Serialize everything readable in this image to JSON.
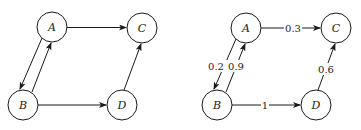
{
  "graphs": [
    {
      "name": "unweighted",
      "nodes": [
        {
          "id": "A",
          "label": "A",
          "x": 52,
          "y": 27
        },
        {
          "id": "B",
          "label": "B",
          "x": 23,
          "y": 105
        },
        {
          "id": "C",
          "label": "C",
          "x": 142,
          "y": 28
        },
        {
          "id": "D",
          "label": "D",
          "x": 122,
          "y": 105
        }
      ],
      "edges": [
        {
          "from": "A",
          "to": "C",
          "label": ""
        },
        {
          "from": "A",
          "to": "B",
          "label": ""
        },
        {
          "from": "B",
          "to": "A",
          "label": ""
        },
        {
          "from": "B",
          "to": "D",
          "label": ""
        },
        {
          "from": "D",
          "to": "C",
          "label": ""
        }
      ]
    },
    {
      "name": "weighted",
      "nodes": [
        {
          "id": "A",
          "label": "A",
          "x": 246,
          "y": 28
        },
        {
          "id": "B",
          "label": "B",
          "x": 217,
          "y": 105
        },
        {
          "id": "C",
          "label": "C",
          "x": 336,
          "y": 28
        },
        {
          "id": "D",
          "label": "D",
          "x": 316,
          "y": 105
        }
      ],
      "edges": [
        {
          "from": "A",
          "to": "C",
          "label": "0.3"
        },
        {
          "from": "A",
          "to": "B",
          "label": "0.2"
        },
        {
          "from": "B",
          "to": "A",
          "label": "0.9"
        },
        {
          "from": "B",
          "to": "D",
          "label": "1"
        },
        {
          "from": "D",
          "to": "C",
          "label": "0.6"
        }
      ]
    }
  ],
  "style": {
    "stroke_color": "#1a1a1a",
    "background": "#ffffff",
    "node_radius": 15
  }
}
